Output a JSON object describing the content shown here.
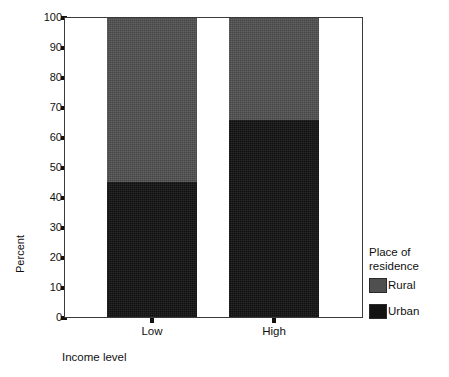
{
  "chart_data": {
    "type": "bar",
    "subtype": "stacked-100-percent",
    "title": "",
    "xlabel": "Income level",
    "ylabel": "Percent",
    "categories": [
      "Low",
      "High"
    ],
    "series": [
      {
        "name": "Rural",
        "color": "#4f4f4f",
        "values": [
          55,
          34
        ]
      },
      {
        "name": "Urban",
        "color": "#131313",
        "values": [
          45,
          66
        ]
      }
    ],
    "stack_order_bottom_to_top": [
      "Urban",
      "Rural"
    ],
    "ylim": [
      0,
      100
    ],
    "yticks": [
      0,
      10,
      20,
      30,
      40,
      50,
      60,
      70,
      80,
      90,
      100
    ],
    "ytick_labels": [
      "0",
      "10",
      "20",
      "30",
      "40",
      "50",
      "60",
      "70",
      "80",
      "90",
      "100"
    ],
    "grid": false,
    "legend": {
      "title": "Place of\nresidence",
      "position": "right",
      "entries": [
        {
          "label": "Rural",
          "color": "#4f4f4f"
        },
        {
          "label": "Urban",
          "color": "#131313"
        }
      ]
    }
  },
  "axes": {
    "y_title": "Percent",
    "x_title": "Income level",
    "y_ticks": [
      "100",
      "90",
      "80",
      "70",
      "60",
      "50",
      "40",
      "30",
      "20",
      "10",
      "0"
    ],
    "x_ticks": [
      "Low",
      "High"
    ]
  },
  "legend": {
    "title": "Place of\nresidence",
    "entries": [
      {
        "label": "Rural"
      },
      {
        "label": "Urban"
      }
    ]
  }
}
